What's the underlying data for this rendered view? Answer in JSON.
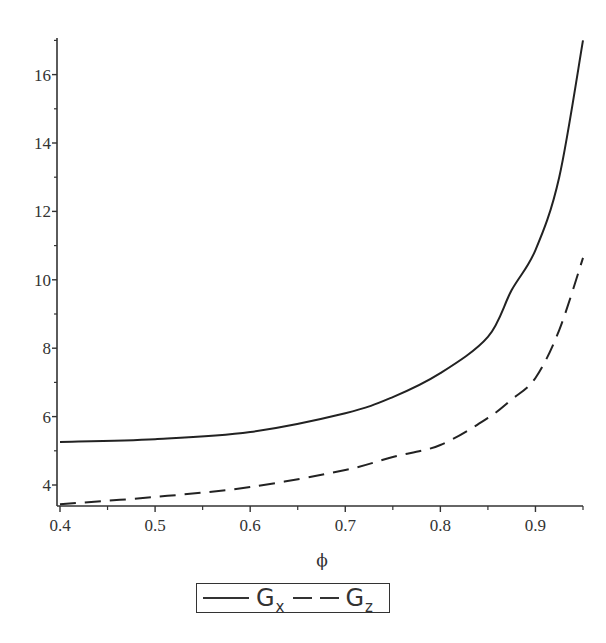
{
  "chart_data": {
    "type": "line",
    "title": "",
    "xlabel": "ϕ",
    "ylabel": "",
    "xlim": [
      0.4,
      0.95
    ],
    "ylim": [
      3.4,
      17.1
    ],
    "grid": false,
    "legend_position": "bottom",
    "x_ticks": [
      "0.4",
      "0.5",
      "0.6",
      "0.7",
      "0.8",
      "0.9"
    ],
    "y_ticks": [
      "4",
      "6",
      "8",
      "10",
      "12",
      "14",
      "16"
    ],
    "x": [
      0.4,
      0.5,
      0.6,
      0.7,
      0.75,
      0.8,
      0.85,
      0.875,
      0.9,
      0.925,
      0.95
    ],
    "series": [
      {
        "name": "Gx",
        "style": "solid",
        "values": [
          5.26,
          5.34,
          5.55,
          6.1,
          6.57,
          7.27,
          8.33,
          9.7,
          10.87,
          13.0,
          17.0
        ]
      },
      {
        "name": "Gz",
        "style": "dashed",
        "values": [
          3.44,
          3.65,
          3.94,
          4.44,
          4.82,
          5.17,
          5.96,
          6.5,
          7.13,
          8.53,
          10.64
        ]
      }
    ]
  },
  "legend": {
    "items": [
      {
        "main": "G",
        "sub": "x"
      },
      {
        "main": "G",
        "sub": "z"
      }
    ]
  }
}
